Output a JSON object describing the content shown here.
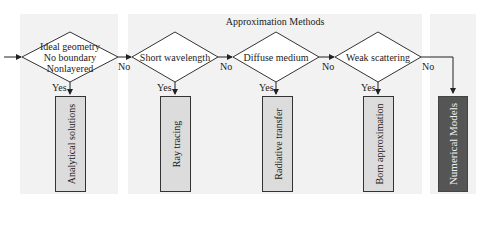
{
  "title": "Approximation Methods",
  "decisions": [
    {
      "lines": [
        "Ideal geometry",
        "No boundary",
        "Nonlayered"
      ]
    },
    {
      "lines": [
        "Short wavelength"
      ]
    },
    {
      "lines": [
        "Diffuse medium"
      ]
    },
    {
      "lines": [
        "Weak scattering"
      ]
    }
  ],
  "outcomes": [
    {
      "label": "Analytical solutions"
    },
    {
      "label": "Ray tracing"
    },
    {
      "label": "Radiative transfer"
    },
    {
      "label": "Born approximation"
    },
    {
      "label": "Numerical Models"
    }
  ],
  "edge_labels": {
    "yes": "Yes",
    "no": "No"
  },
  "colors": {
    "panel": "#f2f2f2",
    "box": "#dcdcdc",
    "box_dark": "#555555",
    "line": "#333333"
  }
}
